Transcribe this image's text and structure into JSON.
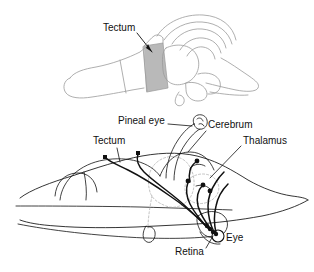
{
  "figure": {
    "background_color": "#ffffff",
    "ink_color": "#111111",
    "faint_ink_color": "#9a9a9a",
    "dashed_region_color": "#a8a8a8",
    "tectum_shading_color": "#b9b9b9",
    "width": 314,
    "height": 272
  },
  "panels": [
    {
      "id": "upper-panel",
      "name": "brain-dorsal-view-with-tectum-shaded",
      "description": "Faint grey line drawing of a reptile brain in oblique view with the optic tectum shaded grey",
      "labels": [
        {
          "id": "tectum-upper",
          "text": "Tectum",
          "x": 103,
          "y": 28,
          "anchor": "start",
          "leader": true
        }
      ]
    },
    {
      "id": "lower-panel",
      "name": "head-sagittal-section-with-visual-pathways",
      "description": "Sagittal outline of a tuatara head showing retinal and pineal nerve tracts terminating at dots in the tectum, thalamus and cerebrum",
      "labels": [
        {
          "id": "pineal-eye",
          "text": "Pineal eye",
          "x": 118,
          "y": 121,
          "anchor": "start",
          "leader": true
        },
        {
          "id": "cerebrum",
          "text": "Cerebrum",
          "x": 208,
          "y": 125,
          "anchor": "start",
          "leader": true
        },
        {
          "id": "thalamus",
          "text": "Thalamus",
          "x": 243,
          "y": 141,
          "anchor": "start",
          "leader": true
        },
        {
          "id": "tectum-lower",
          "text": "Tectum",
          "x": 93,
          "y": 141,
          "anchor": "start",
          "leader": true
        },
        {
          "id": "eye",
          "text": "Eye",
          "x": 226,
          "y": 238,
          "anchor": "start",
          "leader": false
        },
        {
          "id": "retina",
          "text": "Retina",
          "x": 175,
          "y": 252,
          "anchor": "start",
          "leader": true
        }
      ]
    }
  ]
}
